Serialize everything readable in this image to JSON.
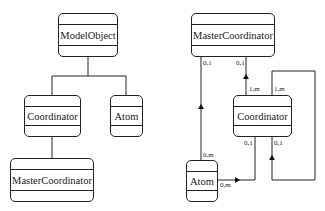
{
  "inheritance_diagram": {
    "classes": [
      {
        "id": "model_object",
        "name": "ModelObject"
      },
      {
        "id": "coordinator",
        "name": "Coordinator"
      },
      {
        "id": "atom",
        "name": "Atom"
      },
      {
        "id": "master_coordinator",
        "name": "MasterCoordinator"
      }
    ],
    "generalizations": [
      {
        "child": "Coordinator",
        "parent": "ModelObject"
      },
      {
        "child": "Atom",
        "parent": "ModelObject"
      },
      {
        "child": "MasterCoordinator",
        "parent": "Coordinator"
      }
    ]
  },
  "association_diagram": {
    "classes": [
      {
        "id": "master_coordinator",
        "name": "MasterCoordinator"
      },
      {
        "id": "coordinator",
        "name": "Coordinator"
      },
      {
        "id": "atom",
        "name": "Atom"
      }
    ],
    "associations": [
      {
        "from": "Atom",
        "to": "MasterCoordinator",
        "from_mult": "0,m",
        "to_mult": "0,1"
      },
      {
        "from": "Coordinator",
        "to": "MasterCoordinator",
        "from_mult": "1,m",
        "to_mult": "0,1"
      },
      {
        "from": "Atom",
        "to": "Coordinator",
        "from_mult": "0,m",
        "to_mult": "0,1"
      },
      {
        "from": "Coordinator",
        "to": "Coordinator",
        "from_mult": "1,m",
        "to_mult": "0,1"
      }
    ],
    "labels": {
      "mc_left_bottom": "0,1",
      "mc_right_bottom": "0,1",
      "coord_top_left": "1,m",
      "coord_top_right": "1,m",
      "coord_bottom_left": "0,1",
      "coord_bottom_right": "0,1",
      "atom_top": "0,m",
      "atom_right": "0,m"
    }
  }
}
